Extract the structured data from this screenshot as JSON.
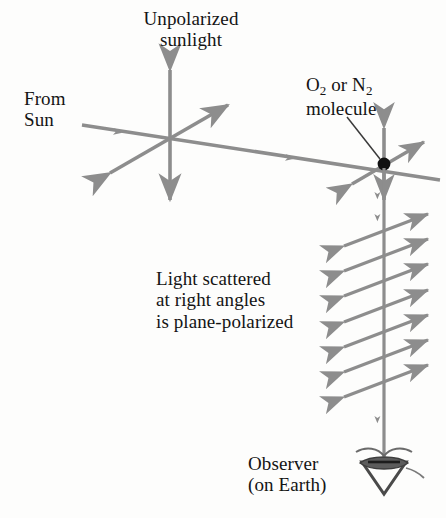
{
  "figure": {
    "background_color": "#fdfdfc",
    "ray_color": "#8d8d8d",
    "leader_color": "#3a3a3a",
    "molecule_dot_color": "#111111",
    "text_color": "#141414"
  },
  "labels": {
    "unpolarized_line1": "Unpolarized",
    "unpolarized_line2": "sunlight",
    "from_sun_line1": "From",
    "from_sun_line2": "Sun",
    "molecule_o": "O",
    "molecule_o_sub": "2",
    "molecule_or": " or N",
    "molecule_n_sub": "2",
    "molecule_line2": "molecule",
    "scattered_line1": "Light scattered",
    "scattered_line2": "at right angles",
    "scattered_line3": "is plane-polarized",
    "observer_line1": "Observer",
    "observer_line2": "(on Earth)"
  },
  "geometry": {
    "sun_ray": {
      "x1": 82,
      "y1": 125,
      "x2": 440,
      "y2": 180
    },
    "crossing_point": {
      "x": 170,
      "y": 141
    },
    "vertical_oscillation": {
      "x": 170,
      "y_top": 64,
      "y_bottom": 206
    },
    "diagonal_oscillation": {
      "x1": 104,
      "y1": 177,
      "x2": 234,
      "y2": 102
    },
    "molecule_point": {
      "x": 384,
      "y": 164
    },
    "molecule_leader": {
      "x1": 347,
      "y1": 117,
      "x2": 380,
      "y2": 159
    },
    "scattered_beam": {
      "x": 384,
      "y_top": 172,
      "y_bottom": 462
    },
    "polarization_arrows_y": [
      232,
      258,
      283,
      309,
      333,
      359,
      385
    ],
    "polarization_arrow_dx": 46,
    "polarization_arrow_dy": 18,
    "beam_direction_arrows_y": [
      196,
      218,
      420
    ],
    "observer_eye": {
      "x": 384,
      "y": 466,
      "width": 46,
      "height": 30
    }
  }
}
